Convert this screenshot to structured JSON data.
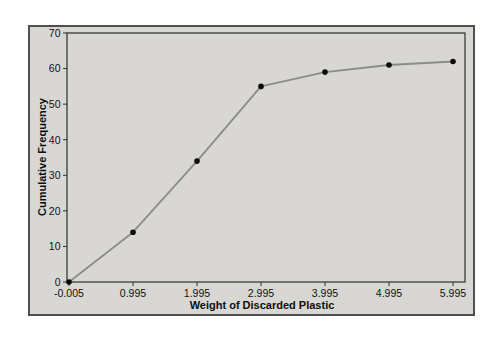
{
  "page": {
    "background": "#ffffff"
  },
  "chart_data": {
    "type": "line",
    "title": "",
    "xlabel": "Weight of Discarded Plastic",
    "ylabel": "Cumulative Frequency",
    "x": [
      -0.005,
      0.995,
      1.995,
      2.995,
      3.995,
      4.995,
      5.995
    ],
    "y": [
      0,
      14,
      34,
      55,
      59,
      61,
      62
    ],
    "x_tick_labels": [
      "-0.005",
      "0.995",
      "1.995",
      "2.995",
      "3.995",
      "4.995",
      "5.995"
    ],
    "y_ticks": [
      0,
      10,
      20,
      30,
      40,
      50,
      60,
      70
    ],
    "xlim": [
      -0.005,
      6.2
    ],
    "ylim": [
      0,
      70
    ],
    "grid": false,
    "legend": "none",
    "marker": "filled-circle",
    "styles": {
      "plot_bg": "#d8d7d3",
      "outer_border": "#4f4f4f",
      "frame_color": "#2e2e2e",
      "line_color": "#8b8b8d",
      "marker_color": "#0a0a0a",
      "text_color": "#111111"
    }
  }
}
